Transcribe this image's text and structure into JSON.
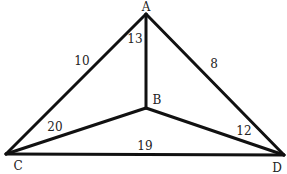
{
  "diagram": {
    "type": "graph",
    "vertices": [
      {
        "id": "A",
        "label": "A",
        "x": 146,
        "y": 14,
        "lx": 146,
        "ly": 11
      },
      {
        "id": "B",
        "label": "B",
        "x": 146,
        "y": 108,
        "lx": 157,
        "ly": 104
      },
      {
        "id": "C",
        "label": "C",
        "x": 6,
        "y": 154,
        "lx": 18,
        "ly": 170
      },
      {
        "id": "D",
        "label": "D",
        "x": 284,
        "y": 155,
        "lx": 277,
        "ly": 172
      }
    ],
    "edges": [
      {
        "from": "A",
        "to": "C",
        "weight": "10",
        "lx": 82,
        "ly": 65
      },
      {
        "from": "A",
        "to": "D",
        "weight": "8",
        "lx": 214,
        "ly": 68
      },
      {
        "from": "A",
        "to": "B",
        "weight": "13",
        "lx": 135,
        "ly": 43
      },
      {
        "from": "B",
        "to": "C",
        "weight": "20",
        "lx": 55,
        "ly": 131
      },
      {
        "from": "B",
        "to": "D",
        "weight": "12",
        "lx": 244,
        "ly": 135
      },
      {
        "from": "C",
        "to": "D",
        "weight": "19",
        "lx": 145,
        "ly": 150
      }
    ]
  }
}
